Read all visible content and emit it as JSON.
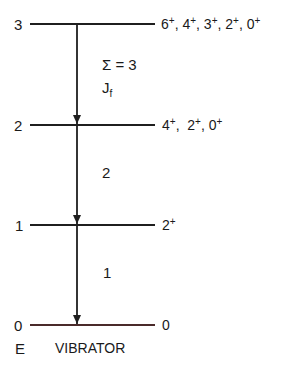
{
  "diagram": {
    "model": "VIBRATOR",
    "axis_label": "E",
    "line_color": "#1f1f1f",
    "ground_line_color": "#4a2a2a",
    "levels": [
      {
        "energy": "3",
        "spins": [
          "6",
          "4",
          "3",
          "2",
          "0"
        ],
        "parity": "+"
      },
      {
        "energy": "2",
        "spins": [
          "4",
          "2",
          "0"
        ],
        "parity": "+"
      },
      {
        "energy": "1",
        "spins": [
          "2"
        ],
        "parity": "+"
      },
      {
        "energy": "0",
        "spins": [
          "0"
        ],
        "parity": ""
      }
    ],
    "transitions": [
      {
        "from": "3",
        "to": "2",
        "label_line1": "Σ = 3",
        "label_line2_base": "J",
        "label_line2_sub": "f"
      },
      {
        "from": "2",
        "to": "1",
        "label": "2"
      },
      {
        "from": "1",
        "to": "0",
        "label": "1"
      }
    ]
  }
}
